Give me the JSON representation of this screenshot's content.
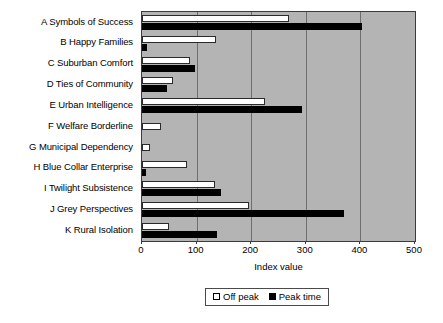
{
  "chart_data": {
    "type": "bar",
    "orientation": "horizontal",
    "title": "",
    "xlabel": "Index value",
    "ylabel": "",
    "xlim": [
      0,
      500
    ],
    "xticks": [
      0,
      100,
      200,
      300,
      400,
      500
    ],
    "grid": true,
    "legend_position": "bottom",
    "plot_background": "#b4b4b4",
    "categories": [
      "A Symbols of Success",
      "B Happy Families",
      "C Suburban Comfort",
      "D Ties of Community",
      "E Urban Intelligence",
      "F Welfare Borderline",
      "G Municipal Dependency",
      "H Blue Collar Enterprise",
      "I Twilight Subsistence",
      "J Grey Perspectives",
      "K Rural Isolation"
    ],
    "series": [
      {
        "name": "Off peak",
        "color": "#ffffff",
        "values": [
          269,
          135,
          88,
          57,
          225,
          35,
          15,
          82,
          133,
          196,
          50
        ]
      },
      {
        "name": "Peak time",
        "color": "#000000",
        "values": [
          403,
          10,
          97,
          45,
          293,
          0,
          0,
          7,
          145,
          370,
          137
        ]
      }
    ]
  },
  "legend": {
    "entries": [
      {
        "label": "Off peak",
        "swatch": "offpeak"
      },
      {
        "label": "Peak time",
        "swatch": "peak"
      }
    ]
  }
}
